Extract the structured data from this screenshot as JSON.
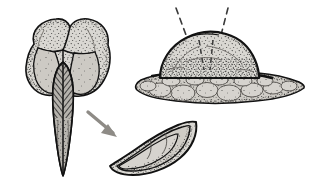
{
  "plate": {
    "width": 310,
    "height": 188,
    "background_color": "#ffffff",
    "style": "stipple-and-hatch line drawing",
    "caption": "",
    "title": ""
  },
  "palette": {
    "outline": "#111111",
    "body_fill": "#d9d7d2",
    "body_fill_dark": "#c3c0ba",
    "keel_fill": "#b5b2ac",
    "stipple": "#2b2b2b",
    "substrate_fill": "#cfccc6",
    "arrow_fill": "#8e8b86",
    "dash_line": "#3a3a3a",
    "highlight": "#e8e6e2"
  },
  "figures": [
    {
      "id": "lobed-body",
      "name": "lobed stippled body with central keel",
      "position": "top-left",
      "label": "",
      "parts": [
        {
          "name": "upper-left-lobe",
          "label": ""
        },
        {
          "name": "upper-right-lobe",
          "label": ""
        },
        {
          "name": "lower-left-lobe",
          "label": ""
        },
        {
          "name": "lower-right-lobe",
          "label": ""
        },
        {
          "name": "central-hatched-keel",
          "label": ""
        },
        {
          "name": "tapered-point",
          "label": ""
        }
      ]
    },
    {
      "id": "crescent-detail",
      "name": "crescent boat-shaped detail inset",
      "position": "bottom-center",
      "label": "",
      "parts": [
        {
          "name": "outer-valve-rim",
          "label": ""
        },
        {
          "name": "inner-chamber-upper",
          "label": ""
        },
        {
          "name": "inner-chamber-lower",
          "label": ""
        }
      ]
    },
    {
      "id": "dome-on-substrate",
      "name": "dome mound resting on cobble substrate",
      "position": "right",
      "label": "",
      "parts": [
        {
          "name": "dome-cap",
          "label": ""
        },
        {
          "name": "substrate-lens",
          "label": ""
        },
        {
          "name": "cobble-clasts",
          "label": ""
        }
      ]
    }
  ],
  "connectors": [
    {
      "name": "detail-arrow",
      "type": "solid-arrow",
      "from": "lobed-body",
      "to": "crescent-detail",
      "label": ""
    },
    {
      "name": "leader-line-left",
      "type": "dashed-leader",
      "target": "dome-on-substrate",
      "label": ""
    },
    {
      "name": "leader-line-right",
      "type": "dashed-leader",
      "target": "dome-on-substrate",
      "label": ""
    }
  ]
}
